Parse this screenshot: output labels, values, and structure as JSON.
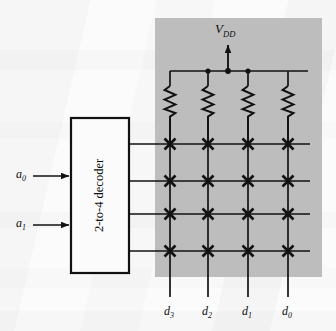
{
  "figure": {
    "kind": "circuit-schematic"
  },
  "panel": {
    "name": "rom-array-panel",
    "fill": "#bdbdbd"
  },
  "supply": {
    "label_main": "V",
    "label_sub": "DD",
    "arrow": "up-arrow-icon"
  },
  "decoder": {
    "label": "2-to-4 decoder"
  },
  "inputs": [
    {
      "name": "a0",
      "base": "a",
      "sub": "0"
    },
    {
      "name": "a1",
      "base": "a",
      "sub": "1"
    }
  ],
  "outputs": [
    {
      "name": "d3",
      "base": "d",
      "sub": "3"
    },
    {
      "name": "d2",
      "base": "d",
      "sub": "2"
    },
    {
      "name": "d1",
      "base": "d",
      "sub": "1"
    },
    {
      "name": "d0",
      "base": "d",
      "sub": "0"
    }
  ],
  "array": {
    "rows": 4,
    "columns": 4,
    "cell_marker": "x-cross-icon",
    "resistor_count": 4,
    "junction_dots": 3
  },
  "colors": {
    "ink": "#121212",
    "panel": "#bdbdbd",
    "paper": "#fbfbfb"
  }
}
